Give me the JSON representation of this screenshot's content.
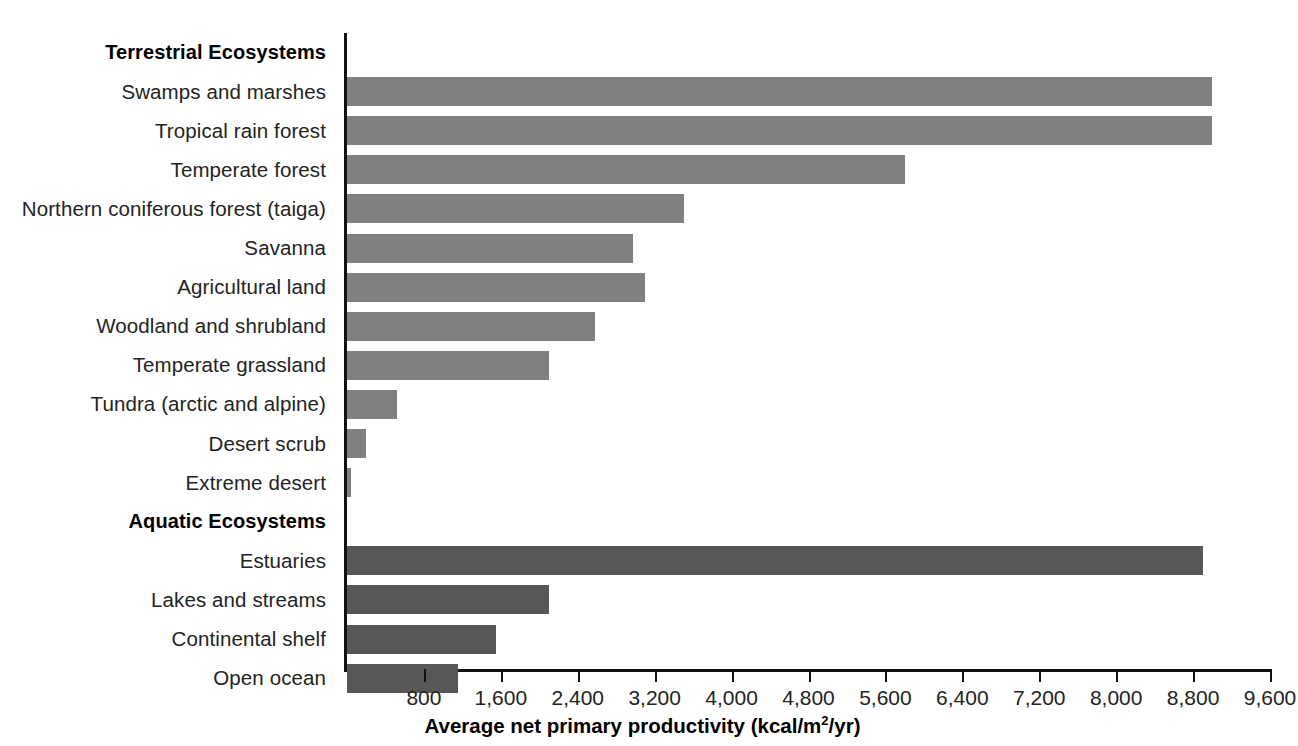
{
  "caption": {
    "lines": [
      "raph",
      "stimated",
      "net pri-",
      "y (NPP)",
      "es and",
      "ressed",
      "f energy",
      "uare",
      "kcal/",
      "m R. H.",
      "munities",
      " 2nd ed.,",
      "nillan,"
    ],
    "italic_line_index": 10
  },
  "chart_data": {
    "type": "bar",
    "orientation": "horizontal",
    "title": "",
    "xlabel": "Average net primary productivity (kcal/m2/yr)",
    "xlabel_display": "Average net primary productivity (kcal/m",
    "xlabel_sup": "2",
    "xlabel_tail": "/yr)",
    "ylabel": "",
    "xlim": [
      0,
      9600
    ],
    "xticks": [
      800,
      1600,
      2400,
      3200,
      4000,
      4800,
      5600,
      6400,
      7200,
      8000,
      8800,
      9600
    ],
    "xticklabels": [
      "800",
      "1,600",
      "2,400",
      "3,200",
      "4,000",
      "4,800",
      "5,600",
      "6,400",
      "7,200",
      "8,000",
      "8,800",
      "9,600"
    ],
    "grid": false,
    "legend": false,
    "colors": {
      "terrestrial": "#808080",
      "aquatic": "#575757",
      "axis": "#111111",
      "text": "#232323"
    },
    "rows": [
      {
        "label": "Terrestrial Ecosystems",
        "kind": "heading",
        "group": "terrestrial",
        "value": null
      },
      {
        "label": "Swamps and marshes",
        "kind": "bar",
        "group": "terrestrial",
        "value": 9000
      },
      {
        "label": "Tropical rain forest",
        "kind": "bar",
        "group": "terrestrial",
        "value": 9000
      },
      {
        "label": "Temperate forest",
        "kind": "bar",
        "group": "terrestrial",
        "value": 5800
      },
      {
        "label": "Northern coniferous forest (taiga)",
        "kind": "bar",
        "group": "terrestrial",
        "value": 3500
      },
      {
        "label": "Savanna",
        "kind": "bar",
        "group": "terrestrial",
        "value": 2970
      },
      {
        "label": "Agricultural land",
        "kind": "bar",
        "group": "terrestrial",
        "value": 3100
      },
      {
        "label": "Woodland and shrubland",
        "kind": "bar",
        "group": "terrestrial",
        "value": 2580
      },
      {
        "label": "Temperate grassland",
        "kind": "bar",
        "group": "terrestrial",
        "value": 2100
      },
      {
        "label": "Tundra (arctic and alpine)",
        "kind": "bar",
        "group": "terrestrial",
        "value": 520
      },
      {
        "label": "Desert scrub",
        "kind": "bar",
        "group": "terrestrial",
        "value": 200
      },
      {
        "label": "Extreme desert",
        "kind": "bar",
        "group": "terrestrial",
        "value": 40
      },
      {
        "label": "Aquatic Ecosystems",
        "kind": "heading",
        "group": "aquatic",
        "value": null
      },
      {
        "label": "Estuaries",
        "kind": "bar",
        "group": "aquatic",
        "value": 8900
      },
      {
        "label": "Lakes and streams",
        "kind": "bar",
        "group": "aquatic",
        "value": 2100
      },
      {
        "label": "Continental shelf",
        "kind": "bar",
        "group": "aquatic",
        "value": 1550
      },
      {
        "label": "Open ocean",
        "kind": "bar",
        "group": "aquatic",
        "value": 1150
      }
    ]
  }
}
